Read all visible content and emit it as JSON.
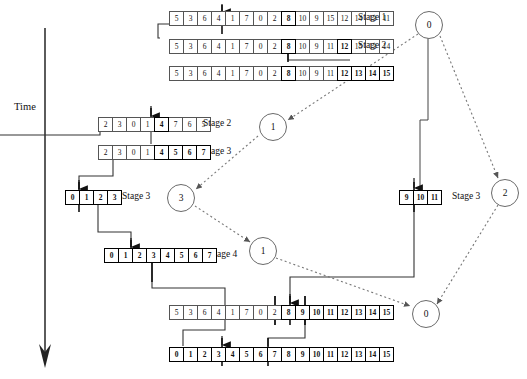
{
  "diagram": {
    "time_axis": {
      "label": "Time",
      "direction": "down"
    },
    "arrays": [
      {
        "name": "row-stage1-top",
        "x": 170,
        "y": 11,
        "stage_label": "Stage 1",
        "label_x": 358,
        "label_y": 12,
        "cells": [
          {
            "v": "5",
            "b": false
          },
          {
            "v": "3",
            "b": false
          },
          {
            "v": "6",
            "b": false
          },
          {
            "v": "4",
            "b": false
          },
          {
            "v": "1",
            "b": false
          },
          {
            "v": "7",
            "b": false
          },
          {
            "v": "0",
            "b": false
          },
          {
            "v": "2",
            "b": false
          },
          {
            "v": "8",
            "b": true
          },
          {
            "v": "10",
            "b": false
          },
          {
            "v": "9",
            "b": false
          },
          {
            "v": "15",
            "b": false
          },
          {
            "v": "12",
            "b": false
          },
          {
            "v": "14",
            "b": false
          },
          {
            "v": "13",
            "b": false
          },
          {
            "v": "11",
            "b": false
          }
        ]
      },
      {
        "name": "row-stage2-top",
        "x": 170,
        "y": 39,
        "stage_label": "Stage 2",
        "label_x": 358,
        "label_y": 40,
        "cells": [
          {
            "v": "5",
            "b": false
          },
          {
            "v": "3",
            "b": false
          },
          {
            "v": "6",
            "b": false
          },
          {
            "v": "4",
            "b": false
          },
          {
            "v": "1",
            "b": false
          },
          {
            "v": "7",
            "b": false
          },
          {
            "v": "0",
            "b": false
          },
          {
            "v": "2",
            "b": false
          },
          {
            "v": "8",
            "b": true
          },
          {
            "v": "10",
            "b": false
          },
          {
            "v": "9",
            "b": false
          },
          {
            "v": "11",
            "b": false
          },
          {
            "v": "12",
            "b": true
          },
          {
            "v": "15",
            "b": false
          },
          {
            "v": "13",
            "b": false
          },
          {
            "v": "14",
            "b": false
          }
        ]
      },
      {
        "name": "row-stage3-top",
        "x": 170,
        "y": 66,
        "stage_label": "Stage 3",
        "label_x": 358,
        "label_y": 67,
        "cells": [
          {
            "v": "5",
            "b": false
          },
          {
            "v": "3",
            "b": false
          },
          {
            "v": "6",
            "b": false
          },
          {
            "v": "4",
            "b": false
          },
          {
            "v": "1",
            "b": false
          },
          {
            "v": "7",
            "b": false
          },
          {
            "v": "0",
            "b": false
          },
          {
            "v": "2",
            "b": false
          },
          {
            "v": "8",
            "b": true
          },
          {
            "v": "10",
            "b": false
          },
          {
            "v": "9",
            "b": false
          },
          {
            "v": "11",
            "b": false
          },
          {
            "v": "12",
            "b": true
          },
          {
            "v": "13",
            "b": true
          },
          {
            "v": "14",
            "b": true
          },
          {
            "v": "15",
            "b": true
          }
        ]
      },
      {
        "name": "row-stage2-left",
        "x": 99,
        "y": 117,
        "stage_label": "Stage 2",
        "label_x": 203,
        "label_y": 118,
        "cells": [
          {
            "v": "2",
            "b": false
          },
          {
            "v": "3",
            "b": false
          },
          {
            "v": "0",
            "b": false
          },
          {
            "v": "1",
            "b": false
          },
          {
            "v": "4",
            "b": true
          },
          {
            "v": "7",
            "b": false
          },
          {
            "v": "6",
            "b": false
          },
          {
            "v": "5",
            "b": false
          }
        ]
      },
      {
        "name": "row-stage3-left",
        "x": 99,
        "y": 145,
        "stage_label": "Stage 3",
        "label_x": 203,
        "label_y": 146,
        "cells": [
          {
            "v": "2",
            "b": false
          },
          {
            "v": "3",
            "b": false
          },
          {
            "v": "0",
            "b": false
          },
          {
            "v": "1",
            "b": false
          },
          {
            "v": "4",
            "b": true
          },
          {
            "v": "5",
            "b": true
          },
          {
            "v": "6",
            "b": true
          },
          {
            "v": "7",
            "b": true
          }
        ]
      },
      {
        "name": "row-stage3-quad",
        "x": 66,
        "y": 190,
        "stage_label": "Stage 3",
        "label_x": 122,
        "label_y": 191,
        "cells": [
          {
            "v": "0",
            "b": true
          },
          {
            "v": "1",
            "b": true
          },
          {
            "v": "2",
            "b": true
          },
          {
            "v": "3",
            "b": true
          }
        ]
      },
      {
        "name": "row-stage3-right",
        "x": 400,
        "y": 190,
        "stage_label": "Stage 3",
        "label_x": 452,
        "label_y": 191,
        "cells": [
          {
            "v": "9",
            "b": true
          },
          {
            "v": "10",
            "b": true
          },
          {
            "v": "11",
            "b": true
          }
        ]
      },
      {
        "name": "row-stage4-left",
        "x": 105,
        "y": 248,
        "stage_label": "Stage 4",
        "label_x": 209,
        "label_y": 249,
        "cells": [
          {
            "v": "0",
            "b": true
          },
          {
            "v": "1",
            "b": true
          },
          {
            "v": "2",
            "b": true
          },
          {
            "v": "3",
            "b": true
          },
          {
            "v": "4",
            "b": true
          },
          {
            "v": "5",
            "b": true
          },
          {
            "v": "6",
            "b": true
          },
          {
            "v": "7",
            "b": true
          }
        ]
      },
      {
        "name": "row-stage4-bottom",
        "x": 170,
        "y": 305,
        "stage_label": "Stage 4",
        "label_x": 358,
        "label_y": 306,
        "cells": [
          {
            "v": "5",
            "b": false
          },
          {
            "v": "3",
            "b": false
          },
          {
            "v": "6",
            "b": false
          },
          {
            "v": "4",
            "b": false
          },
          {
            "v": "1",
            "b": false
          },
          {
            "v": "7",
            "b": false
          },
          {
            "v": "0",
            "b": false
          },
          {
            "v": "2",
            "b": false
          },
          {
            "v": "8",
            "b": true
          },
          {
            "v": "9",
            "b": true
          },
          {
            "v": "10",
            "b": true
          },
          {
            "v": "11",
            "b": true
          },
          {
            "v": "12",
            "b": true
          },
          {
            "v": "13",
            "b": true
          },
          {
            "v": "14",
            "b": true
          },
          {
            "v": "15",
            "b": true
          }
        ]
      },
      {
        "name": "row-stage5-final",
        "x": 170,
        "y": 347,
        "stage_label": "Stage 5",
        "label_x": 358,
        "label_y": 348,
        "cells": [
          {
            "v": "0",
            "b": true
          },
          {
            "v": "1",
            "b": true
          },
          {
            "v": "2",
            "b": true
          },
          {
            "v": "3",
            "b": true
          },
          {
            "v": "4",
            "b": true
          },
          {
            "v": "5",
            "b": true
          },
          {
            "v": "6",
            "b": true
          },
          {
            "v": "7",
            "b": true
          },
          {
            "v": "8",
            "b": true
          },
          {
            "v": "9",
            "b": true
          },
          {
            "v": "10",
            "b": true
          },
          {
            "v": "11",
            "b": true
          },
          {
            "v": "12",
            "b": true
          },
          {
            "v": "13",
            "b": true
          },
          {
            "v": "14",
            "b": true
          },
          {
            "v": "15",
            "b": true
          }
        ]
      }
    ],
    "nodes": [
      {
        "name": "node-0-top",
        "label": "0",
        "cx": 428,
        "cy": 24
      },
      {
        "name": "node-1-upper-middle",
        "label": "1",
        "cx": 272,
        "cy": 126
      },
      {
        "name": "node-3-left",
        "label": "3",
        "cx": 180,
        "cy": 197
      },
      {
        "name": "node-2-right",
        "label": "2",
        "cx": 504,
        "cy": 192
      },
      {
        "name": "node-1-lower-middle",
        "label": "1",
        "cx": 262,
        "cy": 250
      },
      {
        "name": "node-0-bottom",
        "label": "0",
        "cx": 425,
        "cy": 313
      }
    ]
  }
}
